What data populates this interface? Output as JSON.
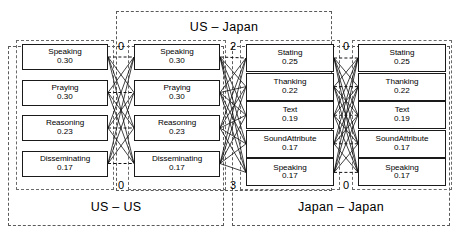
{
  "diagram": {
    "title_hidden": "",
    "groups": [
      {
        "id": "us-us",
        "label": "US – US"
      },
      {
        "id": "us-japan",
        "label": "US – Japan"
      },
      {
        "id": "japan-japan",
        "label": "Japan – Japan"
      }
    ],
    "columns": [
      {
        "id": "col-us-1",
        "side": "US",
        "nodes": [
          {
            "label": "Speaking",
            "value": "0.30"
          },
          {
            "label": "Praying",
            "value": "0.30"
          },
          {
            "label": "Reasoning",
            "value": "0.23"
          },
          {
            "label": "Disseminating",
            "value": "0.17"
          }
        ]
      },
      {
        "id": "col-us-2",
        "side": "US",
        "nodes": [
          {
            "label": "Speaking",
            "value": "0.30"
          },
          {
            "label": "Praying",
            "value": "0.30"
          },
          {
            "label": "Reasoning",
            "value": "0.23"
          },
          {
            "label": "Disseminating",
            "value": "0.17"
          }
        ]
      },
      {
        "id": "col-japan-1",
        "side": "Japan",
        "nodes": [
          {
            "label": "Stating",
            "value": "0.25"
          },
          {
            "label": "Thanking",
            "value": "0.22"
          },
          {
            "label": "Text",
            "value": "0.19"
          },
          {
            "label": "SoundAttribute",
            "value": "0.17"
          },
          {
            "label": "Speaking",
            "value": "0.17"
          }
        ]
      },
      {
        "id": "col-japan-2",
        "side": "Japan",
        "nodes": [
          {
            "label": "Stating",
            "value": "0.25"
          },
          {
            "label": "Thanking",
            "value": "0.22"
          },
          {
            "label": "Text",
            "value": "0.19"
          },
          {
            "label": "SoundAttribute",
            "value": "0.17"
          },
          {
            "label": "Speaking",
            "value": "0.17"
          }
        ]
      }
    ],
    "gap_numbers": [
      {
        "id": "gap-1-top",
        "value": "0"
      },
      {
        "id": "gap-1-bottom",
        "value": "0"
      },
      {
        "id": "gap-2-top",
        "value": "2"
      },
      {
        "id": "gap-2-bottom",
        "value": "3"
      },
      {
        "id": "gap-3-top",
        "value": "0"
      },
      {
        "id": "gap-3-bottom",
        "value": "0"
      }
    ],
    "colors": {
      "node_border": "#1a1a1a",
      "group_border": "#5a5a5a",
      "edge": "#111111",
      "background": "#ffffff"
    }
  }
}
